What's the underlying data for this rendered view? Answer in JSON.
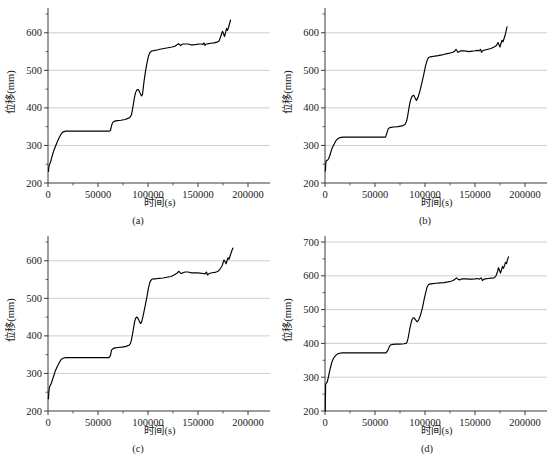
{
  "figure": {
    "background": "#ffffff",
    "curve_color": "#000000",
    "grid_color": "#c9c9c9",
    "axis_color": "#3a3a3a",
    "panel_count": 4
  },
  "chart_data": [
    {
      "type": "line",
      "panel": "a",
      "caption": "(a)",
      "title": "",
      "xlabel": "时间(s)",
      "ylabel": "位移(mm)",
      "xlim": [
        0,
        200000
      ],
      "ylim": [
        200,
        650
      ],
      "xticks": [
        0,
        50000,
        100000,
        150000,
        200000
      ],
      "xtick_labels": [
        "0",
        "50000",
        "100000",
        "150000",
        "200000"
      ],
      "yticks": [
        200,
        300,
        400,
        500,
        600
      ],
      "ytick_labels": [
        "200",
        "300",
        "400",
        "500",
        "600"
      ],
      "y_minor_ticks": [
        250,
        350,
        450,
        550,
        650
      ],
      "grid": "horizontal",
      "legend": "none",
      "series": [
        {
          "name": "位移",
          "x": [
            500,
            900,
            1400,
            2000,
            2800,
            3600,
            4600,
            5800,
            7200,
            9000,
            11000,
            13000,
            15000,
            18000,
            25000,
            35000,
            45000,
            55000,
            61000,
            62500,
            63500,
            64500,
            66000,
            69000,
            73000,
            77000,
            80000,
            82000,
            83500,
            84500,
            85500,
            86500,
            87500,
            88500,
            89500,
            90500,
            91500,
            92500,
            93500,
            94500,
            96000,
            97500,
            99000,
            100500,
            102000,
            103500,
            105000,
            107000,
            109000,
            112000,
            116000,
            120000,
            124000,
            127000,
            129000,
            130500,
            131500,
            132500,
            133500,
            135000,
            137000,
            140000,
            143000,
            146000,
            149000,
            151000,
            153000,
            155000,
            156000,
            157000,
            158000,
            159000,
            160500,
            163000,
            166000,
            169000,
            171000,
            172500,
            173500,
            174500,
            175500,
            176500,
            177500,
            178500,
            179500,
            180500,
            181500,
            182500
          ],
          "y": [
            231,
            244,
            249,
            252,
            258,
            266,
            276,
            286,
            296,
            308,
            320,
            330,
            336,
            338,
            338,
            338,
            338,
            338,
            338,
            340,
            352,
            360,
            364,
            366,
            367,
            369,
            372,
            375,
            382,
            396,
            412,
            428,
            440,
            446,
            449,
            448,
            443,
            437,
            432,
            436,
            470,
            498,
            520,
            538,
            548,
            551,
            552,
            553,
            554,
            556,
            558,
            560,
            562,
            564,
            568,
            571,
            569,
            566,
            568,
            570,
            570,
            570,
            568,
            568,
            569,
            570,
            570,
            569,
            573,
            566,
            570,
            570,
            571,
            572,
            573,
            575,
            578,
            588,
            596,
            604,
            598,
            590,
            600,
            612,
            606,
            614,
            624,
            634
          ]
        }
      ]
    },
    {
      "type": "line",
      "panel": "b",
      "caption": "(b)",
      "title": "",
      "xlabel": "时间(s)",
      "ylabel": "位移(mm)",
      "xlim": [
        0,
        200000
      ],
      "ylim": [
        200,
        650
      ],
      "xticks": [
        0,
        50000,
        100000,
        150000,
        200000
      ],
      "xtick_labels": [
        "0",
        "50000",
        "100000",
        "150000",
        "200000"
      ],
      "yticks": [
        200,
        300,
        400,
        500,
        600
      ],
      "ytick_labels": [
        "200",
        "300",
        "400",
        "500",
        "600"
      ],
      "y_minor_ticks": [
        250,
        350,
        450,
        550,
        650
      ],
      "grid": "horizontal",
      "legend": "none",
      "series": [
        {
          "name": "位移",
          "x": [
            400,
            800,
            1200,
            1800,
            2600,
            3400,
            4400,
            5600,
            7000,
            8800,
            10800,
            12800,
            15000,
            18000,
            25000,
            35000,
            45000,
            55000,
            60500,
            62000,
            63200,
            64500,
            66000,
            69000,
            73000,
            77000,
            80000,
            81500,
            82500,
            83500,
            84500,
            85500,
            86500,
            87500,
            88500,
            89500,
            90500,
            91500,
            93000,
            95000,
            97000,
            99000,
            100500,
            102000,
            103500,
            105500,
            108000,
            110000,
            113000,
            117000,
            121000,
            125000,
            128000,
            130000,
            131000,
            132000,
            133000,
            134500,
            136000,
            138000,
            141000,
            144000,
            147000,
            150000,
            152000,
            154000,
            155500,
            156500,
            157500,
            158500,
            160000,
            163000,
            166000,
            169000,
            171500,
            173000,
            174000,
            175000,
            176000,
            177000,
            178000,
            179000,
            180000,
            181000,
            182000
          ],
          "y": [
            232,
            252,
            258,
            260,
            261,
            264,
            270,
            280,
            292,
            302,
            312,
            318,
            321,
            322,
            322,
            322,
            322,
            322,
            322,
            334,
            344,
            347,
            348,
            349,
            350,
            352,
            356,
            364,
            376,
            392,
            408,
            420,
            428,
            432,
            434,
            430,
            424,
            420,
            428,
            446,
            468,
            492,
            512,
            526,
            534,
            536,
            537,
            538,
            539,
            541,
            544,
            546,
            548,
            552,
            556,
            552,
            548,
            550,
            552,
            552,
            551,
            550,
            551,
            552,
            553,
            552,
            556,
            548,
            552,
            553,
            554,
            556,
            558,
            562,
            566,
            574,
            568,
            562,
            572,
            580,
            576,
            584,
            592,
            604,
            616
          ]
        }
      ]
    },
    {
      "type": "line",
      "panel": "c",
      "caption": "(c)",
      "title": "",
      "xlabel": "时间(s)",
      "ylabel": "位移(mm)",
      "xlim": [
        0,
        200000
      ],
      "ylim": [
        200,
        650
      ],
      "xticks": [
        0,
        50000,
        100000,
        150000,
        200000
      ],
      "xtick_labels": [
        "0",
        "50000",
        "100000",
        "150000",
        "200000"
      ],
      "yticks": [
        200,
        300,
        400,
        500,
        600
      ],
      "ytick_labels": [
        "200",
        "300",
        "400",
        "500",
        "600"
      ],
      "y_minor_ticks": [
        250,
        350,
        450,
        550,
        650
      ],
      "grid": "horizontal",
      "legend": "none",
      "series": [
        {
          "name": "位移",
          "x": [
            400,
            900,
            1500,
            2200,
            3000,
            3800,
            4800,
            6000,
            7500,
            9500,
            11500,
            13500,
            15500,
            18000,
            25000,
            35000,
            45000,
            55000,
            61000,
            62500,
            63500,
            65000,
            67000,
            70000,
            74000,
            78000,
            81000,
            82500,
            83500,
            84500,
            85500,
            86500,
            87500,
            88500,
            89500,
            90500,
            91500,
            92500,
            93500,
            95000,
            97000,
            99000,
            100500,
            102000,
            103500,
            105500,
            108000,
            111000,
            115000,
            119000,
            123000,
            126000,
            128500,
            130000,
            131000,
            132000,
            133500,
            135000,
            137000,
            140000,
            143000,
            146000,
            149000,
            152000,
            155000,
            157000,
            158500,
            159500,
            161000,
            164000,
            167000,
            170000,
            172000,
            174000,
            175000,
            176000,
            177000,
            178000,
            179000,
            180000,
            181000,
            182000,
            183000,
            184000,
            185000
          ],
          "y": [
            233,
            252,
            264,
            268,
            272,
            278,
            286,
            296,
            308,
            320,
            330,
            338,
            341,
            342,
            342,
            342,
            342,
            342,
            342,
            348,
            362,
            366,
            368,
            369,
            370,
            372,
            375,
            380,
            390,
            404,
            420,
            436,
            446,
            450,
            449,
            444,
            438,
            433,
            436,
            452,
            478,
            505,
            528,
            544,
            550,
            552,
            552,
            553,
            554,
            556,
            558,
            562,
            566,
            570,
            572,
            568,
            566,
            568,
            570,
            570,
            568,
            568,
            568,
            567,
            566,
            565,
            570,
            562,
            566,
            568,
            569,
            572,
            578,
            586,
            594,
            602,
            598,
            592,
            600,
            608,
            604,
            612,
            620,
            628,
            634
          ]
        }
      ]
    },
    {
      "type": "line",
      "panel": "d",
      "caption": "(d)",
      "title": "",
      "xlabel": "时间(s)",
      "ylabel": "位移(mm)",
      "xlim": [
        0,
        200000
      ],
      "ylim": [
        200,
        700
      ],
      "xticks": [
        0,
        50000,
        100000,
        150000,
        200000
      ],
      "xtick_labels": [
        "0",
        "50000",
        "100000",
        "150000",
        "200000"
      ],
      "yticks": [
        200,
        300,
        400,
        500,
        600,
        700
      ],
      "ytick_labels": [
        "200",
        "300",
        "400",
        "500",
        "600",
        "700"
      ],
      "y_minor_ticks": [
        250,
        350,
        450,
        550,
        650
      ],
      "grid": "horizontal",
      "legend": "none",
      "series": [
        {
          "name": "位移",
          "x": [
            300,
            600,
            1000,
            1600,
            2400,
            3200,
            4200,
            5400,
            6800,
            8500,
            10500,
            12500,
            14500,
            17000,
            25000,
            35000,
            45000,
            55000,
            61000,
            63000,
            64500,
            66000,
            68000,
            71000,
            75000,
            79000,
            81000,
            82000,
            83000,
            84000,
            85000,
            86000,
            87000,
            88000,
            89000,
            90000,
            91000,
            92000,
            93500,
            95500,
            97500,
            99000,
            100500,
            102000,
            103500,
            105500,
            108000,
            111000,
            115000,
            119000,
            123000,
            126000,
            128000,
            130000,
            131500,
            133000,
            134500,
            136000,
            138000,
            141000,
            144000,
            147000,
            150000,
            152500,
            154500,
            156000,
            157500,
            159000,
            160500,
            163000,
            166000,
            169000,
            171000,
            172500,
            173500,
            174500,
            175500,
            176500,
            177500,
            178500,
            179500,
            180500,
            181500,
            182500,
            183500
          ],
          "y": [
            200,
            278,
            281,
            283,
            288,
            298,
            312,
            328,
            344,
            356,
            364,
            369,
            371,
            372,
            372,
            372,
            372,
            372,
            372,
            380,
            392,
            396,
            397,
            398,
            398,
            399,
            400,
            404,
            414,
            430,
            446,
            460,
            470,
            475,
            476,
            472,
            468,
            464,
            468,
            484,
            506,
            528,
            548,
            566,
            574,
            576,
            577,
            578,
            579,
            580,
            582,
            584,
            586,
            590,
            594,
            590,
            588,
            590,
            591,
            591,
            590,
            590,
            591,
            592,
            590,
            594,
            586,
            590,
            591,
            592,
            593,
            594,
            600,
            612,
            624,
            616,
            608,
            618,
            628,
            622,
            630,
            640,
            636,
            648,
            656
          ]
        }
      ]
    }
  ]
}
